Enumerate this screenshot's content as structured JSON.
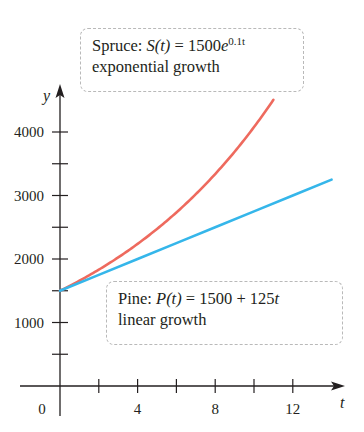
{
  "chart_data": {
    "type": "line",
    "title": "",
    "xlabel": "t",
    "ylabel": "y",
    "xlim": [
      0,
      14
    ],
    "ylim": [
      0,
      4500
    ],
    "x_ticks": [
      0,
      2,
      4,
      6,
      8,
      10,
      12
    ],
    "x_tick_labels": [
      "0",
      "4",
      "8",
      "12"
    ],
    "y_ticks": [
      500,
      1000,
      1500,
      2000,
      2500,
      3000,
      3500,
      4000
    ],
    "y_tick_labels": [
      "1000",
      "2000",
      "3000",
      "4000"
    ],
    "grid": false,
    "series": [
      {
        "name": "Spruce",
        "formula": "S(t) = 1500e^{0.1t}",
        "description": "exponential growth",
        "color": "#ee6a5e",
        "x": [
          0,
          1,
          2,
          3,
          4,
          5,
          6,
          7,
          8,
          9,
          10,
          11
        ],
        "values": [
          1500,
          1658,
          1832,
          2025,
          2238,
          2473,
          2733,
          3021,
          3338,
          3689,
          4077,
          4506
        ]
      },
      {
        "name": "Pine",
        "formula": "P(t) = 1500 + 125t",
        "description": "linear growth",
        "color": "#35b6ea",
        "x": [
          0,
          2,
          4,
          6,
          8,
          10,
          12,
          14
        ],
        "values": [
          1500,
          1750,
          2000,
          2250,
          2500,
          2750,
          3000,
          3250
        ]
      }
    ]
  },
  "labels": {
    "spruce": {
      "name": "Spruce:",
      "func": "S(t)",
      "eq": " = 1500",
      "base": "e",
      "exp": "0.1t",
      "desc": "exponential growth"
    },
    "pine": {
      "name": "Pine:",
      "func": "P(t)",
      "eq": " = 1500 + 125",
      "var": "t",
      "desc": "linear growth"
    }
  },
  "axes": {
    "x_name": "t",
    "y_name": "y",
    "origin_label": "0"
  }
}
